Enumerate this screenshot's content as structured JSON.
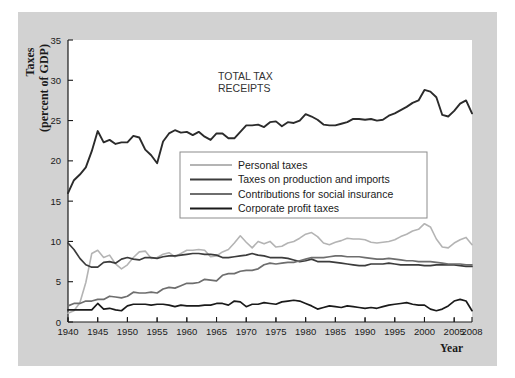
{
  "figure": {
    "background_color": "#ffffff",
    "panel_color": "#d2d2d2",
    "plot_color": "#ffffff"
  },
  "axis": {
    "ylabel_line1": "Taxes",
    "ylabel_line2": "(percent of GDP)",
    "xlabel": "Year",
    "yticks": [
      "0",
      "5",
      "10",
      "15",
      "20",
      "25",
      "30",
      "35"
    ],
    "xticks": [
      "1940",
      "1945",
      "1950",
      "1955",
      "1960",
      "1965",
      "1970",
      "1975",
      "1980",
      "1985",
      "1990",
      "1995",
      "2000",
      "2005",
      "2008"
    ]
  },
  "annotation": {
    "line1": "TOTAL TAX",
    "line2": "RECEIPTS"
  },
  "legend": {
    "items": [
      {
        "label": "Personal taxes",
        "color": "#b4b4b4"
      },
      {
        "label": "Taxes on production and imports",
        "color": "#3c3c3c"
      },
      {
        "label": "Contributions for social insurance",
        "color": "#6e6e6e"
      },
      {
        "label": "Corporate profit taxes",
        "color": "#1a1a1a"
      }
    ]
  },
  "chart_data": {
    "type": "line",
    "title": "",
    "xlabel": "Year",
    "ylabel": "Taxes (percent of GDP)",
    "xlim": [
      1940,
      2008
    ],
    "ylim": [
      0,
      35
    ],
    "grid": false,
    "legend_position": "center",
    "annotations": [
      {
        "text": "TOTAL TAX RECEIPTS",
        "x": 1967,
        "y": 31
      }
    ],
    "x": [
      1940,
      1941,
      1942,
      1943,
      1944,
      1945,
      1946,
      1947,
      1948,
      1949,
      1950,
      1951,
      1952,
      1953,
      1954,
      1955,
      1956,
      1957,
      1958,
      1959,
      1960,
      1961,
      1962,
      1963,
      1964,
      1965,
      1966,
      1967,
      1968,
      1969,
      1970,
      1971,
      1972,
      1973,
      1974,
      1975,
      1976,
      1977,
      1978,
      1979,
      1980,
      1981,
      1982,
      1983,
      1984,
      1985,
      1986,
      1987,
      1988,
      1989,
      1990,
      1991,
      1992,
      1993,
      1994,
      1995,
      1996,
      1997,
      1998,
      1999,
      2000,
      2001,
      2002,
      2003,
      2004,
      2005,
      2006,
      2007,
      2008
    ],
    "series": [
      {
        "name": "Total tax receipts",
        "color": "#2b2b2b",
        "width": 1.9,
        "labeled_on_chart": true,
        "values": [
          16.0,
          17.6,
          18.3,
          19.2,
          21.2,
          23.7,
          22.3,
          22.6,
          22.1,
          22.3,
          22.3,
          23.1,
          22.9,
          21.4,
          20.7,
          19.7,
          22.4,
          23.4,
          23.8,
          23.5,
          23.6,
          23.2,
          23.6,
          23.0,
          22.6,
          23.4,
          23.4,
          22.8,
          22.8,
          23.6,
          24.4,
          24.4,
          24.5,
          24.2,
          24.8,
          24.9,
          24.3,
          24.8,
          24.7,
          25.0,
          25.8,
          25.5,
          25.1,
          24.5,
          24.4,
          24.4,
          24.6,
          24.8,
          25.2,
          25.2,
          25.1,
          25.2,
          25.0,
          25.1,
          25.6,
          25.9,
          26.3,
          26.7,
          27.2,
          27.5,
          28.8,
          28.6,
          27.9,
          25.7,
          25.5,
          26.2,
          27.1,
          27.5,
          25.9
        ]
      },
      {
        "name": "Personal taxes",
        "color": "#b4b4b4",
        "width": 1.6,
        "values": [
          1.1,
          1.4,
          2.4,
          4.9,
          8.5,
          8.9,
          8.0,
          8.3,
          7.2,
          6.6,
          7.1,
          8.0,
          8.7,
          8.8,
          7.9,
          8.0,
          8.4,
          8.6,
          8.1,
          8.5,
          8.9,
          8.9,
          9.0,
          8.9,
          8.1,
          8.2,
          8.7,
          9.0,
          9.8,
          10.7,
          9.9,
          9.2,
          10.0,
          9.7,
          10.0,
          9.3,
          9.4,
          9.8,
          10.0,
          10.4,
          10.9,
          11.1,
          10.6,
          9.8,
          9.6,
          9.9,
          10.1,
          10.4,
          10.3,
          10.3,
          10.2,
          9.9,
          9.8,
          9.9,
          10.0,
          10.2,
          10.6,
          10.9,
          11.3,
          11.5,
          12.2,
          11.8,
          10.3,
          9.3,
          9.2,
          9.8,
          10.2,
          10.5,
          9.6
        ]
      },
      {
        "name": "Taxes on production and imports",
        "color": "#3c3c3c",
        "width": 1.7,
        "values": [
          9.8,
          9.0,
          7.9,
          7.1,
          6.8,
          6.8,
          7.4,
          7.5,
          7.3,
          7.8,
          8.0,
          7.8,
          7.7,
          8.0,
          8.0,
          7.9,
          8.1,
          8.2,
          8.2,
          8.3,
          8.4,
          8.5,
          8.5,
          8.4,
          8.4,
          8.3,
          8.0,
          8.0,
          8.1,
          8.2,
          8.3,
          8.5,
          8.3,
          8.2,
          8.0,
          8.0,
          8.0,
          7.9,
          7.7,
          7.5,
          7.6,
          7.8,
          7.5,
          7.5,
          7.5,
          7.4,
          7.3,
          7.2,
          7.1,
          7.0,
          7.0,
          7.2,
          7.2,
          7.2,
          7.3,
          7.2,
          7.1,
          7.1,
          7.1,
          7.1,
          7.0,
          7.0,
          7.1,
          7.1,
          7.1,
          7.1,
          7.0,
          6.9,
          6.9
        ]
      },
      {
        "name": "Contributions for social insurance",
        "color": "#6e6e6e",
        "width": 1.7,
        "values": [
          2.0,
          2.3,
          2.3,
          2.6,
          2.6,
          2.8,
          2.8,
          3.2,
          3.1,
          3.0,
          3.2,
          3.7,
          3.6,
          3.6,
          3.7,
          3.6,
          4.1,
          4.3,
          4.2,
          4.5,
          4.8,
          4.8,
          4.9,
          5.3,
          5.2,
          5.1,
          5.8,
          6.0,
          6.0,
          6.3,
          6.4,
          6.4,
          6.6,
          7.1,
          7.3,
          7.2,
          7.3,
          7.4,
          7.4,
          7.6,
          7.8,
          8.0,
          8.0,
          8.0,
          8.1,
          8.2,
          8.2,
          8.1,
          8.1,
          8.1,
          8.0,
          7.9,
          7.8,
          7.8,
          7.9,
          7.8,
          7.7,
          7.6,
          7.6,
          7.5,
          7.5,
          7.5,
          7.4,
          7.3,
          7.2,
          7.2,
          7.2,
          7.1,
          7.1
        ]
      },
      {
        "name": "Corporate profit taxes",
        "color": "#1a1a1a",
        "width": 1.7,
        "values": [
          1.5,
          1.5,
          1.5,
          1.5,
          1.5,
          2.3,
          1.6,
          1.7,
          1.5,
          1.4,
          2.0,
          2.2,
          2.2,
          2.2,
          2.1,
          2.2,
          2.2,
          2.1,
          1.9,
          2.1,
          2.0,
          2.0,
          2.0,
          2.1,
          2.1,
          2.3,
          2.3,
          2.1,
          2.6,
          2.5,
          1.9,
          2.2,
          2.2,
          2.4,
          2.3,
          2.2,
          2.5,
          2.6,
          2.7,
          2.6,
          2.3,
          2.0,
          1.6,
          1.8,
          2.0,
          1.9,
          1.8,
          2.0,
          1.9,
          1.8,
          1.7,
          1.8,
          1.7,
          1.9,
          2.1,
          2.2,
          2.3,
          2.4,
          2.2,
          2.1,
          2.1,
          1.6,
          1.4,
          1.6,
          2.0,
          2.6,
          2.8,
          2.6,
          1.4
        ]
      }
    ]
  }
}
